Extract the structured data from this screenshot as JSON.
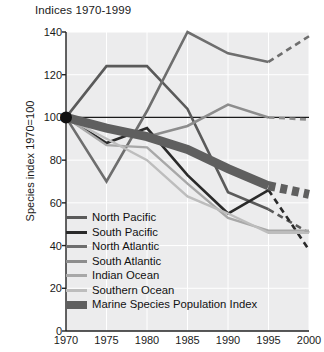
{
  "chart_data": {
    "type": "line",
    "title": "Indices 1970-1999",
    "xlabel": "",
    "ylabel": "Species index 1970=100",
    "xlim": [
      1970,
      2000
    ],
    "ylim": [
      0,
      140
    ],
    "yticks": [
      0,
      20,
      40,
      60,
      80,
      100,
      120,
      140
    ],
    "xticks": [
      1970,
      1975,
      1980,
      1985,
      1990,
      1995,
      2000
    ],
    "grid": true,
    "legend_position": "inside-lower-left",
    "baseline_value": 100,
    "x": [
      1970,
      1975,
      1980,
      1985,
      1990,
      1995,
      2000
    ],
    "series": [
      {
        "name": "North Pacific",
        "color": "#5a5a5a",
        "width": 2.6,
        "values": [
          100,
          124,
          124,
          104,
          65,
          57,
          46
        ],
        "dashed_from": 1995,
        "dashed_values": [
          57,
          46
        ]
      },
      {
        "name": "South Pacific",
        "color": "#2a2a2a",
        "width": 2.6,
        "values": [
          100,
          88,
          95,
          73,
          55,
          66,
          38
        ],
        "dashed_from": 1995,
        "dashed_values": [
          66,
          38
        ]
      },
      {
        "name": "North Atlantic",
        "color": "#6e6e6e",
        "width": 2.6,
        "values": [
          100,
          70,
          103,
          140,
          130,
          126,
          138
        ],
        "dashed_from": 1995,
        "dashed_values": [
          126,
          138
        ]
      },
      {
        "name": "South Atlantic",
        "color": "#8d8d8d",
        "width": 2.6,
        "values": [
          100,
          95,
          91,
          96,
          106,
          100,
          99
        ],
        "dashed_from": 1995,
        "dashed_values": [
          100,
          99
        ]
      },
      {
        "name": "Indian Ocean",
        "color": "#a8a8a8",
        "width": 2.4,
        "values": [
          100,
          87,
          86,
          69,
          53,
          47,
          47
        ]
      },
      {
        "name": "Southern Ocean",
        "color": "#bdbdbd",
        "width": 2.4,
        "values": [
          100,
          90,
          80,
          63,
          55,
          46,
          46
        ]
      },
      {
        "name": "Marine Species Population Index",
        "color": "#5f5f5f",
        "width": 9,
        "band": true,
        "values": [
          100,
          95,
          91,
          85,
          76,
          68,
          64
        ],
        "dashed_from": 1995,
        "dashed_values": [
          68,
          64
        ]
      }
    ],
    "origin_marker": {
      "x": 1970,
      "y": 100
    }
  },
  "axis": {
    "ylabel": "Species index 1970=100",
    "ytick_labels": [
      "140",
      "120",
      "100",
      "80",
      "60",
      "40",
      "20",
      "0"
    ],
    "xtick_labels": [
      "1970",
      "1975",
      "1980",
      "1985",
      "1990",
      "1995",
      "2000"
    ]
  },
  "legend": {
    "items": [
      {
        "label": "North Pacific",
        "color": "#5a5a5a"
      },
      {
        "label": "South Pacific",
        "color": "#2a2a2a"
      },
      {
        "label": "North Atlantic",
        "color": "#6e6e6e"
      },
      {
        "label": "South Atlantic",
        "color": "#8d8d8d"
      },
      {
        "label": "Indian Ocean",
        "color": "#a8a8a8"
      },
      {
        "label": "Southern Ocean",
        "color": "#bdbdbd"
      },
      {
        "label": "Marine Species Population Index",
        "color": "#5f5f5f"
      }
    ]
  }
}
